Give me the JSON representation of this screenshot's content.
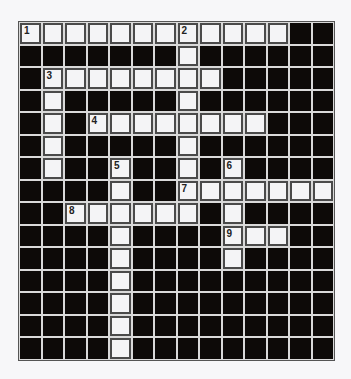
{
  "puzzle": {
    "type": "crossword",
    "rows": 15,
    "cols": 14,
    "colors": {
      "block": "#0d0a08",
      "cell": "#f4f4f6",
      "gridline": "#d9d9d9",
      "cell_border": "#4a4a4a"
    },
    "white_cells": [
      [
        0,
        0
      ],
      [
        0,
        1
      ],
      [
        0,
        2
      ],
      [
        0,
        3
      ],
      [
        0,
        4
      ],
      [
        0,
        5
      ],
      [
        0,
        6
      ],
      [
        0,
        7
      ],
      [
        0,
        8
      ],
      [
        0,
        9
      ],
      [
        0,
        10
      ],
      [
        0,
        11
      ],
      [
        1,
        7
      ],
      [
        2,
        1
      ],
      [
        2,
        2
      ],
      [
        2,
        3
      ],
      [
        2,
        4
      ],
      [
        2,
        5
      ],
      [
        2,
        6
      ],
      [
        2,
        7
      ],
      [
        2,
        8
      ],
      [
        3,
        1
      ],
      [
        3,
        7
      ],
      [
        4,
        1
      ],
      [
        4,
        3
      ],
      [
        4,
        4
      ],
      [
        4,
        5
      ],
      [
        4,
        6
      ],
      [
        4,
        7
      ],
      [
        4,
        8
      ],
      [
        4,
        9
      ],
      [
        4,
        10
      ],
      [
        5,
        1
      ],
      [
        5,
        7
      ],
      [
        6,
        1
      ],
      [
        6,
        4
      ],
      [
        6,
        7
      ],
      [
        6,
        9
      ],
      [
        7,
        4
      ],
      [
        7,
        7
      ],
      [
        7,
        8
      ],
      [
        7,
        9
      ],
      [
        7,
        10
      ],
      [
        7,
        11
      ],
      [
        7,
        12
      ],
      [
        7,
        13
      ],
      [
        8,
        2
      ],
      [
        8,
        3
      ],
      [
        8,
        4
      ],
      [
        8,
        5
      ],
      [
        8,
        6
      ],
      [
        8,
        7
      ],
      [
        8,
        9
      ],
      [
        9,
        4
      ],
      [
        9,
        9
      ],
      [
        9,
        10
      ],
      [
        9,
        11
      ],
      [
        10,
        4
      ],
      [
        10,
        9
      ],
      [
        11,
        4
      ],
      [
        12,
        4
      ],
      [
        13,
        4
      ],
      [
        14,
        4
      ]
    ],
    "numbers": [
      {
        "row": 0,
        "col": 0,
        "label": "1"
      },
      {
        "row": 0,
        "col": 7,
        "label": "2"
      },
      {
        "row": 2,
        "col": 1,
        "label": "3"
      },
      {
        "row": 4,
        "col": 3,
        "label": "4"
      },
      {
        "row": 6,
        "col": 4,
        "label": "5"
      },
      {
        "row": 6,
        "col": 9,
        "label": "6"
      },
      {
        "row": 7,
        "col": 7,
        "label": "7"
      },
      {
        "row": 8,
        "col": 2,
        "label": "8"
      },
      {
        "row": 9,
        "col": 9,
        "label": "9"
      }
    ]
  }
}
